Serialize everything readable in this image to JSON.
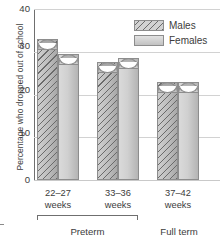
{
  "chart_data": {
    "type": "bar",
    "title": "",
    "xlabel": "",
    "ylabel": "Percentage who dropped out of school",
    "ylim": [
      0,
      40
    ],
    "yticks": [
      0,
      10,
      20,
      30,
      40
    ],
    "ytick_labels": [
      "0",
      "10",
      "20",
      "30",
      "40"
    ],
    "grid": true,
    "legend_position": "top-right",
    "categories": [
      "22–27 weeks",
      "33–36 weeks",
      "37–42 weeks"
    ],
    "category_lines": [
      [
        "22–27",
        "weeks"
      ],
      [
        "33–36",
        "weeks"
      ],
      [
        "37–42",
        "weeks"
      ]
    ],
    "group_labels": [
      "Preterm",
      "Full term"
    ],
    "group_spans": [
      [
        "22–27 weeks",
        "33–36 weeks"
      ],
      [
        "37–42 weeks"
      ]
    ],
    "series": [
      {
        "name": "Males",
        "values": [
          33.0,
          27.5,
          23.0
        ]
      },
      {
        "name": "Females",
        "values": [
          29.5,
          28.5,
          23.0
        ]
      }
    ]
  },
  "legend": {
    "items": [
      {
        "label": "Males",
        "pattern": "diagonal-hatch"
      },
      {
        "label": "Females",
        "pattern": "solid-gray"
      }
    ]
  },
  "axis": {
    "y_title": "Percentage who dropped out of school",
    "y_tick_0": "0",
    "y_tick_1": "10",
    "y_tick_2": "20",
    "y_tick_3": "30",
    "y_tick_4": "40"
  },
  "xaxis": {
    "g0_line1": "22–27",
    "g0_line2": "weeks",
    "g1_line1": "33–36",
    "g1_line2": "weeks",
    "g2_line1": "37–42",
    "g2_line2": "weeks",
    "preterm": "Preterm",
    "fullterm": "Full term"
  },
  "colors": {
    "males_hatch": "#6b6b6b",
    "males_fill": "#bdbdbd",
    "females_fill": "#d0d0d0",
    "grid": "#d2d2d2",
    "axis": "#6f6f6f",
    "text": "#3c3c3c"
  }
}
